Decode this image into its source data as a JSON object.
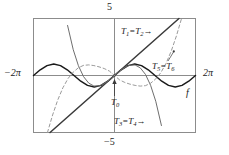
{
  "figure": {
    "title": "",
    "colors": {
      "frame": "#8c8c8c",
      "axis": "#8c8c8c",
      "function_curve": "#1a1a1a",
      "taylor_solid": "#6e6e6e",
      "taylor_dashed": "#9a9a9a",
      "text": "#1a1a1a",
      "background": "#ffffff"
    }
  },
  "axes": {
    "x_left_label": "−2π",
    "x_right_label": "2π",
    "y_top_label": "5",
    "y_bottom_label": "−5",
    "x_min": -6.283185307,
    "x_max": 6.283185307,
    "y_min": -5,
    "y_max": 5
  },
  "annotations": {
    "t12": {
      "name": "T",
      "sub_a": "1",
      "eq": "=",
      "sub_b": "2",
      "arrow": "→"
    },
    "t56": {
      "name": "T",
      "sub_a": "5",
      "eq": "=",
      "sub_b": "6",
      "arrow": ""
    },
    "t34": {
      "name": "T",
      "sub_a": "3",
      "eq": "=",
      "sub_b": "4",
      "arrow": "→"
    },
    "t0": {
      "name": "T",
      "sub_a": "0",
      "arrow": "↑"
    },
    "f": {
      "label": "f"
    }
  },
  "chart_data": {
    "type": "line",
    "title": "",
    "xlabel": "",
    "ylabel": "",
    "xlim": [
      -6.283185307,
      6.283185307
    ],
    "ylim": [
      -5,
      5
    ],
    "xticks": [
      -6.283185307,
      6.283185307
    ],
    "xticklabels": [
      "−2π",
      "2π"
    ],
    "yticks": [
      -5,
      5
    ],
    "yticklabels": [
      "−5",
      "5"
    ],
    "grid": false,
    "legend": "inline-annotations",
    "series": [
      {
        "name": "f",
        "label": "f",
        "expression": "sin(x)",
        "style": "solid",
        "color": "#1a1a1a",
        "width": 1.5,
        "x": [
          -6.283185307,
          -5.759586532,
          -5.235987756,
          -4.71238898,
          -4.188790205,
          -3.665191429,
          -3.141592654,
          -2.617993878,
          -2.094395102,
          -1.570796327,
          -1.047197551,
          -0.523598776,
          0,
          0.523598776,
          1.047197551,
          1.570796327,
          2.094395102,
          2.617993878,
          3.141592654,
          3.665191429,
          4.188790205,
          4.71238898,
          5.235987756,
          5.759586532,
          6.283185307
        ],
        "y": [
          0,
          0.5,
          0.866,
          1,
          0.866,
          0.5,
          0,
          -0.5,
          -0.866,
          -1,
          -0.866,
          -0.5,
          0,
          0.5,
          0.866,
          1,
          0.866,
          0.5,
          0,
          -0.5,
          -0.866,
          -1,
          -0.866,
          -0.5,
          0
        ]
      },
      {
        "name": "T1 = T2",
        "label": "T₁ = T₂",
        "expression": "x",
        "style": "solid",
        "color": "#3a3a3a",
        "width": 1.5,
        "x": [
          -5,
          -2.5,
          0,
          2.5,
          5
        ],
        "y": [
          -5,
          -2.5,
          0,
          2.5,
          5
        ]
      },
      {
        "name": "T3 = T4",
        "label": "T₃ = T₄",
        "expression": "x - x^3/6",
        "style": "solid",
        "color": "#6e6e6e",
        "width": 1.0,
        "x": [
          -3.64,
          -3.2,
          -2.8,
          -2.4,
          -2.0,
          -1.6,
          -1.2,
          -0.8,
          -0.4,
          0,
          0.4,
          0.8,
          1.2,
          1.6,
          2.0,
          2.4,
          2.8,
          3.2,
          3.64
        ],
        "y": [
          4.39,
          2.26,
          0.86,
          -0.1,
          -0.67,
          -0.92,
          -0.91,
          -0.71,
          -0.39,
          0,
          0.39,
          0.71,
          0.91,
          0.92,
          0.67,
          0.1,
          -0.86,
          -2.26,
          -4.39
        ]
      },
      {
        "name": "T5 = T6",
        "label": "T₅ = T₆",
        "expression": "x - x^3/6 + x^5/120",
        "style": "dashed",
        "color": "#9a9a9a",
        "width": 1.0,
        "x": [
          -5.2,
          -4.8,
          -4.4,
          -4.0,
          -3.6,
          -3.2,
          -2.8,
          -2.4,
          -2.0,
          -1.6,
          -1.2,
          -0.8,
          -0.4,
          0,
          0.4,
          0.8,
          1.2,
          1.6,
          2.0,
          2.4,
          2.8,
          3.2,
          3.6,
          4.0,
          4.4,
          4.8,
          5.2
        ],
        "y": [
          -5.0,
          -3.46,
          -2.14,
          -1.07,
          -0.26,
          0.3,
          0.68,
          0.89,
          0.93,
          0.87,
          0.76,
          0.61,
          0.39,
          0,
          -0.39,
          -0.61,
          -0.76,
          -0.87,
          -0.93,
          -0.89,
          -0.68,
          -0.3,
          0.26,
          1.07,
          2.14,
          3.46,
          5.0
        ]
      },
      {
        "name": "T0",
        "label": "T₀",
        "expression": "0",
        "style": "solid",
        "color": "#8c8c8c",
        "width": 1.0,
        "x": [
          -6.283185307,
          6.283185307
        ],
        "y": [
          0,
          0
        ]
      }
    ]
  }
}
